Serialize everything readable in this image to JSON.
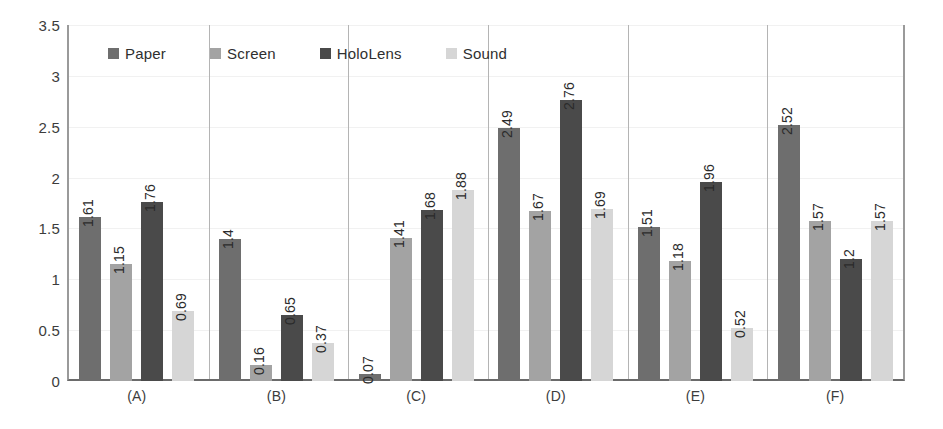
{
  "chart_data": {
    "type": "bar",
    "title": "",
    "subtitle": "",
    "xlabel": "",
    "ylabel": "",
    "ylim": [
      0,
      3.5
    ],
    "ytick_values": [
      0,
      0.5,
      1,
      1.5,
      2,
      2.5,
      3,
      3.5
    ],
    "ytick_labels": [
      "0",
      "0.5",
      "1",
      "1.5",
      "2",
      "2.5",
      "3",
      "3.5"
    ],
    "grid": true,
    "legend_position": "top-left-inside",
    "group_separators": true,
    "categories": [
      "(A)",
      "(B)",
      "(C)",
      "(D)",
      "(E)",
      "(F)"
    ],
    "series": [
      {
        "name": "Paper",
        "color": "#6e6e6e",
        "values": [
          1.61,
          1.4,
          0.07,
          2.49,
          1.51,
          2.52
        ],
        "labels": [
          "1.61",
          "1.4",
          "0.07",
          "2.49",
          "1.51",
          "2.52"
        ]
      },
      {
        "name": "Screen",
        "color": "#a3a3a3",
        "values": [
          1.15,
          0.16,
          1.41,
          1.67,
          1.18,
          1.57
        ],
        "labels": [
          "1.15",
          "0.16",
          "1.41",
          "1.67",
          "1.18",
          "1.57"
        ]
      },
      {
        "name": "HoloLens",
        "color": "#4a4a4a",
        "values": [
          1.76,
          0.65,
          1.68,
          2.76,
          1.96,
          1.2
        ],
        "labels": [
          "1.76",
          "0.65",
          "1.68",
          "2.76",
          "1.96",
          "1.2"
        ]
      },
      {
        "name": "Sound",
        "color": "#d6d6d6",
        "values": [
          0.69,
          0.37,
          1.88,
          1.69,
          0.52,
          1.57
        ],
        "labels": [
          "0.69",
          "0.37",
          "1.88",
          "1.69",
          "0.52",
          "1.57"
        ]
      }
    ]
  },
  "legend": {
    "items": [
      {
        "label": "Paper",
        "color": "#6e6e6e"
      },
      {
        "label": "Screen",
        "color": "#a3a3a3"
      },
      {
        "label": "HoloLens",
        "color": "#4a4a4a"
      },
      {
        "label": "Sound",
        "color": "#d6d6d6"
      }
    ]
  },
  "axes": {
    "y": {
      "min": 0,
      "max": 3.5,
      "ticks": [
        "0",
        "0.5",
        "1",
        "1.5",
        "2",
        "2.5",
        "3",
        "3.5"
      ]
    },
    "x": {
      "ticks": [
        "(A)",
        "(B)",
        "(C)",
        "(D)",
        "(E)",
        "(F)"
      ]
    }
  }
}
